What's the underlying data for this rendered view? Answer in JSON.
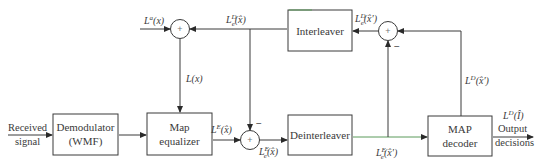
{
  "blocks": {
    "demodulator": {
      "line1": "Demodulator",
      "line2": "(WMF)"
    },
    "map_equalizer": {
      "line1": "Map",
      "line2": "equalizer"
    },
    "interleaver": {
      "line1": "Interleaver"
    },
    "deinterleaver": {
      "line1": "Deinterleaver"
    },
    "map_decoder": {
      "line1": "MAP",
      "line2": "decoder"
    }
  },
  "signals": {
    "input": {
      "line1": "Received",
      "line2": "signal"
    },
    "output": {
      "line1": "Output",
      "line2": "decisions"
    },
    "a_priori": {
      "base": "L",
      "sup": "a",
      "arg": "(x)"
    },
    "extrinsic_decoder": {
      "base": "L",
      "sub": "e",
      "sup": "D",
      "arg": "(x̂)"
    },
    "extrinsic_decoder_interleaved": {
      "base": "L",
      "sub": "e",
      "sup": "D",
      "arg": "(x̂′)"
    },
    "equalizer_input": {
      "base": "L",
      "arg": "(x)"
    },
    "equalizer_output": {
      "base": "L",
      "sup": "E",
      "arg": "(x̂)"
    },
    "extrinsic_equalizer": {
      "base": "L",
      "sub": "e",
      "sup": "E",
      "arg": "(x̂)"
    },
    "extrinsic_equalizer_deinterleaved": {
      "base": "L",
      "sub": "e",
      "sup": "E",
      "arg": "(x̂′)"
    },
    "decoder_output": {
      "base": "L",
      "sup": "D",
      "arg": "(x̂′)"
    },
    "final_output": {
      "base": "L",
      "sup": "D",
      "arg": "(Î)"
    }
  },
  "junctions": {
    "plus": "+",
    "minus": "−"
  },
  "colors": {
    "line": "#3a3a3a",
    "accent_line": "#5a9a5a"
  }
}
